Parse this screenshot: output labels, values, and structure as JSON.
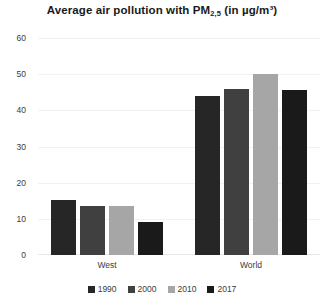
{
  "chart_data": {
    "type": "bar",
    "title": "Average air pollution with PM2,5 (in µg/m³)",
    "title_parts": {
      "before_sub": "Average air pollution with PM",
      "subscript": "2,5",
      "after_sub": " (in µg/m³)"
    },
    "xlabel": "",
    "ylabel": "",
    "ylim": [
      0,
      60
    ],
    "yticks": [
      0,
      10,
      20,
      30,
      40,
      50,
      60
    ],
    "ytick_labels": [
      "0",
      "10",
      "20",
      "30",
      "40",
      "50",
      "60"
    ],
    "grid": true,
    "legend_position": "bottom",
    "categories": [
      "West",
      "World"
    ],
    "series": [
      {
        "name": "1990",
        "color": "#262626",
        "values": [
          15.2,
          44.0
        ]
      },
      {
        "name": "2000",
        "color": "#404040",
        "values": [
          13.6,
          46.0
        ]
      },
      {
        "name": "2010",
        "color": "#a6a6a6",
        "values": [
          13.6,
          50.0
        ]
      },
      {
        "name": "2017",
        "color": "#1a1a1a",
        "values": [
          9.0,
          45.5
        ]
      }
    ]
  },
  "legend": {
    "items": [
      {
        "label": "1990",
        "color": "#262626"
      },
      {
        "label": "2000",
        "color": "#404040"
      },
      {
        "label": "2010",
        "color": "#a6a6a6"
      },
      {
        "label": "2017",
        "color": "#1a1a1a"
      }
    ]
  }
}
